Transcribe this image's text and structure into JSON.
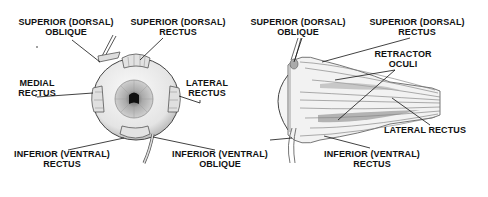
{
  "figure": {
    "left_view": {
      "name": "anterior view",
      "labels": {
        "superior_oblique": [
          "SUPERIOR (DORSAL)",
          "OBLIQUE"
        ],
        "superior_rectus": [
          "SUPERIOR (DORSAL)",
          "RECTUS"
        ],
        "medial_rectus": [
          "MEDIAL",
          "RECTUS"
        ],
        "lateral_rectus": [
          "LATERAL",
          "RECTUS"
        ],
        "inferior_rectus": [
          "INFERIOR (VENTRAL)",
          "RECTUS"
        ],
        "inferior_oblique": [
          "INFERIOR (VENTRAL)",
          "OBLIQUE"
        ]
      }
    },
    "right_view": {
      "name": "lateral view",
      "labels": {
        "superior_oblique": [
          "SUPERIOR (DORSAL)",
          "OBLIQUE"
        ],
        "superior_rectus": [
          "SUPERIOR (DORSAL)",
          "RECTUS"
        ],
        "retractor_oculi": [
          "RETRACTOR",
          "OCULI"
        ],
        "lateral_rectus": [
          "LATERAL RECTUS"
        ],
        "inferior_rectus": [
          "INFERIOR (VENTRAL)",
          "RECTUS"
        ]
      }
    },
    "colors": {
      "ink": "#111111",
      "shade": "#9a9a9a",
      "light_shade": "#d6d6d6",
      "background": "#ffffff"
    }
  }
}
